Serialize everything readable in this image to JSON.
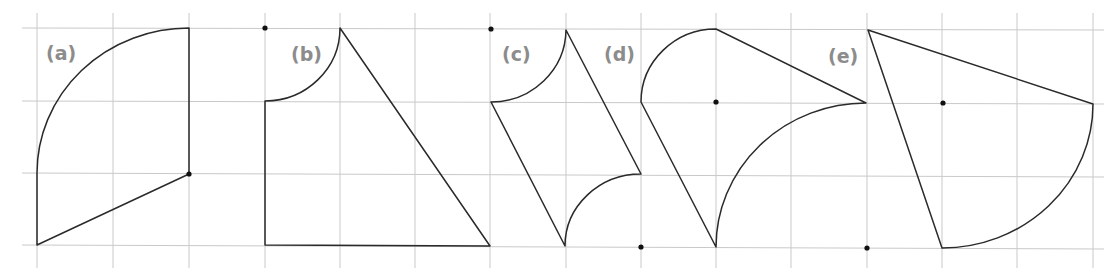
{
  "figure": {
    "colors": {
      "grid": "#c9c9c9",
      "stroke": "#2a2a2a",
      "label": "#8c8c8c",
      "dot": "#111111"
    },
    "grid": {
      "columns_x": [
        37,
        113,
        189,
        265,
        340,
        415,
        490,
        566,
        641,
        716,
        791,
        867,
        942,
        1017,
        1093
      ],
      "rows_y": [
        28,
        102,
        175,
        247
      ]
    },
    "shapes": [
      {
        "label": "(a)",
        "label_pos": [
          46,
          60
        ]
      },
      {
        "label": "(b)",
        "label_pos": [
          291,
          61
        ]
      },
      {
        "label": "(c)",
        "label_pos": [
          502,
          61
        ]
      },
      {
        "label": "(d)",
        "label_pos": [
          604,
          61
        ]
      },
      {
        "label": "(e)",
        "label_pos": [
          828,
          63
        ]
      }
    ]
  }
}
